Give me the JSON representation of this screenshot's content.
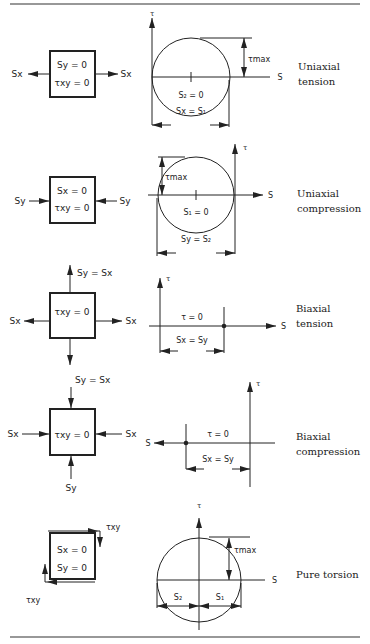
{
  "rows": [
    {
      "label_line1": "Uniaxial",
      "label_line2": "tension",
      "element": {
        "line1": "Sy = 0",
        "line2": "τxy = 0",
        "left_load": "Sx",
        "right_load": "Sx"
      },
      "mohr": {
        "tau_axis": "τ",
        "s_axis": "S",
        "tau_max": "τmax",
        "center_label": "S₂ = 0",
        "dim_label": "Sx = S₁"
      }
    },
    {
      "label_line1": "Uniaxial",
      "label_line2": "compression",
      "element": {
        "line1": "Sx = 0",
        "line2": "τxy = 0",
        "left_load": "Sy",
        "right_load": "Sy"
      },
      "mohr": {
        "tau_axis": "τ",
        "s_axis": "S",
        "tau_max": "τmax",
        "center_label": "S₁ = 0",
        "dim_label": "Sy = S₂"
      }
    },
    {
      "label_line1": "Biaxial",
      "label_line2": "tension",
      "element": {
        "line1": "τxy = 0",
        "top_load": "Sy = Sx",
        "left_load": "Sx",
        "right_load": "Sx"
      },
      "mohr": {
        "tau_axis": "τ",
        "s_axis": "S",
        "point_label": "τ = 0",
        "dim_label": "Sx = Sy"
      }
    },
    {
      "label_line1": "Biaxial",
      "label_line2": "compression",
      "element": {
        "line1": "τxy = 0",
        "top_load": "Sy = Sx",
        "bottom_load": "Sy",
        "left_load": "Sx",
        "right_load": "Sx"
      },
      "mohr": {
        "tau_axis": "τ",
        "s_axis": "S",
        "point_label": "τ = 0",
        "dim_label": "Sx = Sy"
      }
    },
    {
      "label_line1": "Pure torsion",
      "element": {
        "line1": "Sx = 0",
        "line2": "Sy = 0",
        "shear_top": "τxy",
        "shear_bottom": "τxy"
      },
      "mohr": {
        "tau_axis": "τ",
        "s_axis": "S",
        "tau_max": "τmax",
        "left_label": "S₂",
        "right_label": "S₁"
      }
    }
  ]
}
